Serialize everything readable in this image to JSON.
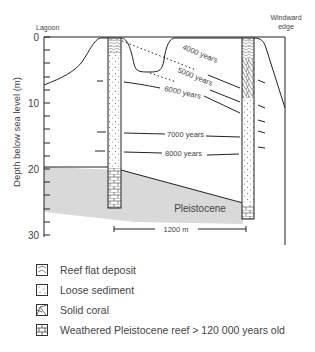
{
  "diagram": {
    "top_labels": {
      "left": "Lagoon",
      "right_line1": "Windward",
      "right_line2": "edge"
    },
    "y_axis": {
      "label": "Depth below sea level (m)",
      "ticks": [
        "0",
        "10",
        "20",
        "30"
      ],
      "range": [
        0,
        30
      ]
    },
    "isochrons": [
      {
        "label": "4000 years",
        "style": "dotted"
      },
      {
        "label": "5000 years",
        "style": "dotted"
      },
      {
        "label": "6000 years",
        "style": "solid"
      },
      {
        "label": "7000 years",
        "style": "solid"
      },
      {
        "label": "8000 years",
        "style": "solid"
      }
    ],
    "basement_label": "Pleistocene",
    "scale_bar": "1200 m",
    "colors": {
      "line": "#222222",
      "pleistocene_fill": "#d9d9d9"
    }
  },
  "legend": {
    "items": [
      {
        "icon": "reef-flat-deposit-swatch",
        "label": "Reef flat deposit"
      },
      {
        "icon": "loose-sediment-swatch",
        "label": "Loose sediment"
      },
      {
        "icon": "solid-coral-swatch",
        "label": "Solid coral"
      },
      {
        "icon": "weathered-pleistocene-swatch",
        "label": "Weathered Pleistocene reef > 120 000 years old"
      }
    ]
  }
}
